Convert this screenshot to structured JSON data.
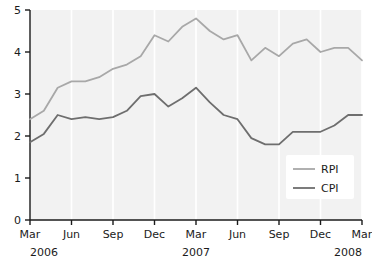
{
  "chart_data": {
    "type": "line",
    "title": "",
    "subtitle": "",
    "xlabel": "",
    "ylabel": "",
    "ylim": [
      0,
      5
    ],
    "y_ticks": [
      0,
      1,
      2,
      3,
      4,
      5
    ],
    "y_tick_labels": [
      "0",
      "1",
      "2",
      "3",
      "4",
      "5"
    ],
    "grid": "vertical-light",
    "legend_position": "bottom-right",
    "x_tick_labels": [
      "Mar",
      "Jun",
      "Sep",
      "Dec",
      "Mar",
      "Jun",
      "Sep",
      "Dec",
      "Mar"
    ],
    "x_tick_months": [
      "2006-03",
      "2006-06",
      "2006-09",
      "2006-12",
      "2007-03",
      "2007-06",
      "2007-09",
      "2007-12",
      "2008-03"
    ],
    "year_labels": [
      {
        "text": "2006",
        "at_month": "2006-03"
      },
      {
        "text": "2007",
        "at_month": "2007-03"
      },
      {
        "text": "2008",
        "at_month": "2008-03"
      }
    ],
    "x": [
      "2006-03",
      "2006-04",
      "2006-05",
      "2006-06",
      "2006-07",
      "2006-08",
      "2006-09",
      "2006-10",
      "2006-11",
      "2006-12",
      "2007-01",
      "2007-02",
      "2007-03",
      "2007-04",
      "2007-05",
      "2007-06",
      "2007-07",
      "2007-08",
      "2007-09",
      "2007-10",
      "2007-11",
      "2007-12",
      "2008-01",
      "2008-02",
      "2008-03"
    ],
    "series": [
      {
        "name": "RPI",
        "color": "#a8a8a8",
        "values": [
          2.4,
          2.6,
          3.15,
          3.3,
          3.3,
          3.4,
          3.6,
          3.7,
          3.9,
          4.4,
          4.25,
          4.6,
          4.8,
          4.5,
          4.3,
          4.4,
          3.8,
          4.1,
          3.9,
          4.2,
          4.3,
          4.0,
          4.1,
          4.1,
          3.8
        ]
      },
      {
        "name": "CPI",
        "color": "#6e6e6e",
        "values": [
          1.85,
          2.05,
          2.5,
          2.4,
          2.45,
          2.4,
          2.45,
          2.6,
          2.95,
          3.0,
          2.7,
          2.9,
          3.15,
          2.8,
          2.5,
          2.4,
          1.95,
          1.8,
          1.8,
          2.1,
          2.1,
          2.1,
          2.25,
          2.5,
          2.5
        ]
      }
    ],
    "legend": [
      {
        "label": "RPI",
        "color": "#a8a8a8"
      },
      {
        "label": "CPI",
        "color": "#6e6e6e"
      }
    ],
    "colors": {
      "rpi": "#a8a8a8",
      "cpi": "#6e6e6e",
      "axis": "#1b1b1b",
      "plot_background": "#f2f2f2",
      "gridline": "#ffffff",
      "legend_background": "#ffffff"
    }
  }
}
